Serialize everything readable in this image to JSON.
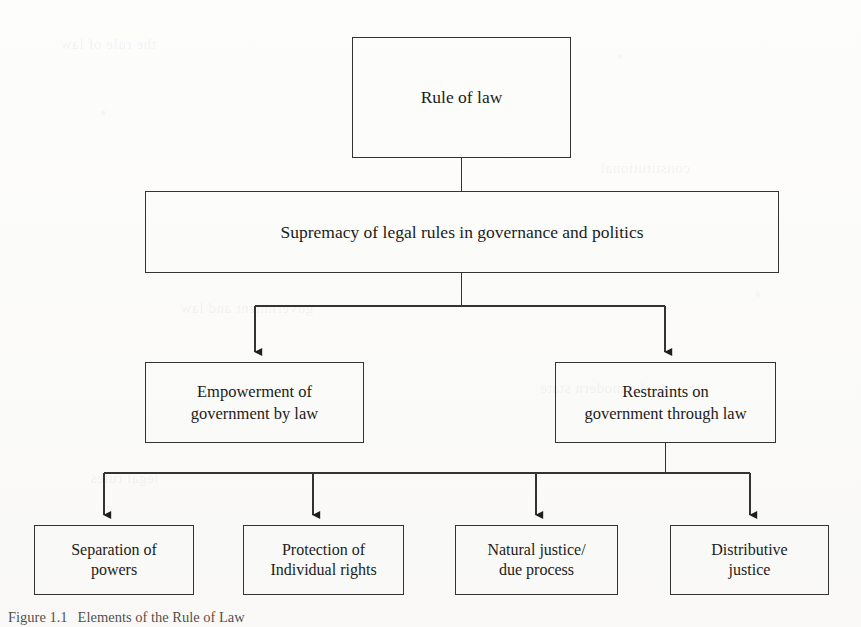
{
  "figure": {
    "title": "Elements of the Rule of Law",
    "caption_number": "Figure 1.1",
    "caption_text": "Elements of the Rule of Law",
    "type": "hierarchical flow chart",
    "ink_color": "#33332f",
    "page_color": "#fdfdfc"
  },
  "nodes": {
    "root": {
      "id": "rule-of-law",
      "label": "Rule of law",
      "level": 1
    },
    "supremacy": {
      "id": "supremacy-of-legal-rules",
      "label": "Supremacy of legal rules in governance and politics",
      "level": 2
    },
    "empowerment": {
      "id": "empowerment-of-government",
      "line1": "Empowerment of",
      "line2": "government by law",
      "level": 3
    },
    "restraints": {
      "id": "restraints-on-government",
      "line1": "Restraints on",
      "line2": "government through law",
      "level": 3
    },
    "leaves": [
      {
        "id": "separation-of-powers",
        "line1": "Separation of",
        "line2": "powers",
        "level": 4
      },
      {
        "id": "protection-of-individual-rights",
        "line1": "Protection of",
        "line2": "Individual rights",
        "level": 4
      },
      {
        "id": "natural-justice-due-process",
        "line1": "Natural justice/",
        "line2": "due process",
        "level": 4
      },
      {
        "id": "distributive-justice",
        "line1": "Distributive",
        "line2": "justice",
        "level": 4
      }
    ]
  },
  "edges": [
    {
      "from": "rule-of-law",
      "to": "supremacy-of-legal-rules",
      "style": "plain-line"
    },
    {
      "from": "supremacy-of-legal-rules",
      "to": "empowerment-of-government",
      "style": "arrow"
    },
    {
      "from": "supremacy-of-legal-rules",
      "to": "restraints-on-government",
      "style": "arrow"
    },
    {
      "from": "restraints-on-government",
      "to": "separation-of-powers",
      "style": "arrow"
    },
    {
      "from": "restraints-on-government",
      "to": "protection-of-individual-rights",
      "style": "arrow"
    },
    {
      "from": "restraints-on-government",
      "to": "natural-justice-due-process",
      "style": "arrow"
    },
    {
      "from": "restraints-on-government",
      "to": "distributive-justice",
      "style": "arrow"
    }
  ],
  "ghost_text": {
    "a": "the rule of law",
    "b": "constitutional",
    "c": "government and law",
    "d": "in the modern state",
    "e": "legal rules"
  }
}
